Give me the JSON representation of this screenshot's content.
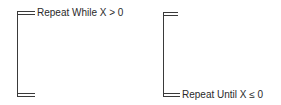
{
  "diagram": {
    "left_loop": {
      "type": "pretest-loop",
      "label": "Repeat While X > 0"
    },
    "right_loop": {
      "type": "posttest-loop",
      "label": "Repeat Until X ≤ 0"
    },
    "colors": {
      "line": "#3a3a3a",
      "text": "#2a2a2a",
      "background": "#ffffff"
    }
  }
}
